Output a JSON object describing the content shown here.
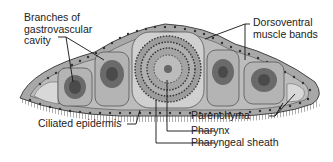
{
  "figure": {
    "colors": {
      "background": "#ffffff",
      "body_fill": "#9a9a9a",
      "epidermis": "#c8c8c8",
      "parenchyma": "#bdbdbd",
      "cavity_dark": "#555555",
      "line": "#111111"
    }
  },
  "labels": {
    "branches_line1": "Branches of",
    "branches_line2": "gastrovascular",
    "branches_line3": "cavity",
    "dorsoventral_line1": "Dorsoventral",
    "dorsoventral_line2": "muscle bands",
    "ciliated_epidermis": "Ciliated epidermis",
    "parenchyma": "Parenchyma",
    "pharynx": "Pharynx",
    "pharyngeal_sheath": "Pharyngeal sheath"
  }
}
